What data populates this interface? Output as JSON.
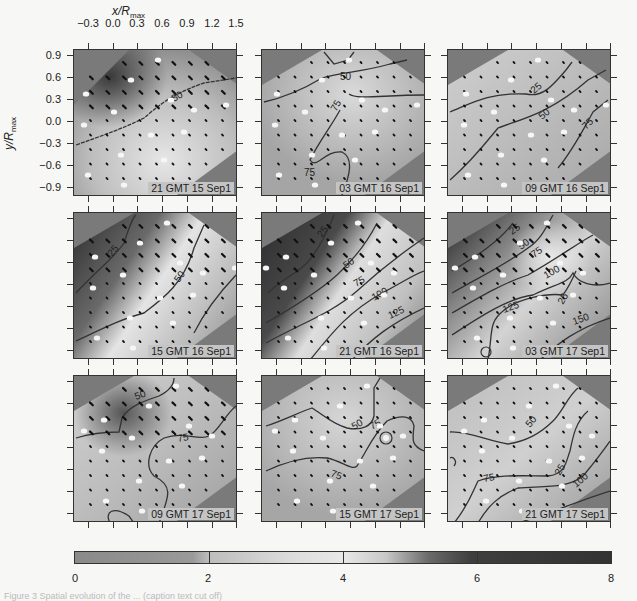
{
  "chart_data": {
    "type": "heatmap",
    "subtype": "contour + vector field small multiples",
    "xlabel": "x/R_max",
    "ylabel": "y/R_max",
    "x_ticks": [
      -0.3,
      0.0,
      0.3,
      0.6,
      0.9,
      1.2,
      1.5
    ],
    "y_ticks": [
      0.9,
      0.6,
      0.3,
      0.0,
      -0.3,
      -0.6,
      -0.9
    ],
    "xlim": [
      -0.45,
      1.6
    ],
    "ylim": [
      -1.0,
      1.0
    ],
    "grid": false,
    "panels": [
      {
        "label": "21 GMT 15 Sep1",
        "contours": [
          50
        ]
      },
      {
        "label": "03 GMT 16 Sep1",
        "contours": [
          50,
          75,
          75
        ]
      },
      {
        "label": "09 GMT 16 Sep1",
        "contours": [
          25,
          50,
          75
        ]
      },
      {
        "label": "15 GMT 16 Sep1",
        "contours": [
          25,
          50
        ]
      },
      {
        "label": "21 GMT 16 Sep1",
        "contours": [
          25,
          50,
          75,
          100,
          125
        ]
      },
      {
        "label": "03 GMT 17 Sep1",
        "contours": [
          25,
          50,
          75,
          100,
          125,
          125,
          150
        ]
      },
      {
        "label": "09 GMT 17 Sep1",
        "contours": [
          50,
          75
        ]
      },
      {
        "label": "15 GMT 17 Sep1",
        "contours": [
          50,
          75,
          75
        ]
      },
      {
        "label": "21 GMT 17 Sep1",
        "contours": [
          50,
          75,
          100,
          125
        ]
      }
    ],
    "colorbar": {
      "ticks": [
        0,
        2,
        4,
        6,
        8
      ],
      "range": [
        0,
        8
      ],
      "colors": [
        "#8a8a8a",
        "#e8e8e8",
        "#333333"
      ]
    }
  },
  "axes": {
    "xlabel_main": "x/R",
    "xlabel_sub": "max",
    "ylabel_main": "y/R",
    "ylabel_sub": "max",
    "x_tick_labels": [
      "−0.3",
      "0.0",
      "0.3",
      "0.6",
      "0.9",
      "1.2",
      "1.5"
    ],
    "y_tick_labels": [
      "0.9",
      "0.6",
      "0.3",
      "0.0",
      "−0.3",
      "−0.6",
      "−0.9"
    ]
  },
  "panels": [
    {
      "stamp": "21 GMT 15 Sep1",
      "labels": [
        "50"
      ]
    },
    {
      "stamp": "03 GMT 16 Sep1",
      "labels": [
        "50",
        "75",
        "75"
      ]
    },
    {
      "stamp": "09 GMT 16 Sep1",
      "labels": [
        "25",
        "50",
        "75"
      ]
    },
    {
      "stamp": "15 GMT 16 Sep1",
      "labels": [
        "25",
        "50"
      ]
    },
    {
      "stamp": "21 GMT 16 Sep1",
      "labels": [
        "25",
        "50",
        "75",
        "100",
        "125"
      ]
    },
    {
      "stamp": "03 GMT 17 Sep1",
      "labels": [
        "25",
        "50",
        "75",
        "100",
        "25",
        "125",
        "150"
      ]
    },
    {
      "stamp": "09 GMT 17 Sep1",
      "labels": [
        "50",
        "75"
      ]
    },
    {
      "stamp": "15 GMT 17 Sep1",
      "labels": [
        "50",
        "75",
        "75"
      ]
    },
    {
      "stamp": "21 GMT 17 Sep1",
      "labels": [
        "50",
        "75",
        "25",
        "100"
      ]
    }
  ],
  "colorbar": {
    "tick_labels": [
      "0",
      "2",
      "4",
      "6",
      "8"
    ]
  },
  "caption": "Figure 3  Spatial evolution of the ... (caption text cut off)"
}
